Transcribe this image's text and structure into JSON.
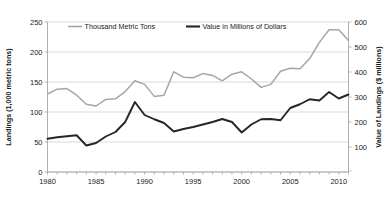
{
  "chart_data": {
    "type": "line",
    "title": "",
    "xlabel": "",
    "ylabel": "Landings (1,000 metric tons)",
    "y2label": "Value of Landings ($ millions)",
    "grid": true,
    "legend_position": "top-inside",
    "xlim": [
      1980,
      2011
    ],
    "ylim": [
      0,
      250
    ],
    "y2lim": [
      0,
      600
    ],
    "x_tick_labels": [
      "1980",
      "1985",
      "1990",
      "1995",
      "2000",
      "2005",
      "2010"
    ],
    "x_tick_values": [
      1980,
      1985,
      1990,
      1995,
      2000,
      2005,
      2010
    ],
    "x_minor_ticks_every": 1,
    "y_tick_labels": [
      "0",
      "50",
      "100",
      "150",
      "200",
      "250"
    ],
    "y_tick_values": [
      0,
      50,
      100,
      150,
      200,
      250
    ],
    "y2_tick_labels": [
      "100",
      "200",
      "300",
      "400",
      "500",
      "600"
    ],
    "y2_tick_values": [
      100,
      200,
      300,
      400,
      500,
      600
    ],
    "x": [
      1980,
      1981,
      1982,
      1983,
      1984,
      1985,
      1986,
      1987,
      1988,
      1989,
      1990,
      1991,
      1992,
      1993,
      1994,
      1995,
      1996,
      1997,
      1998,
      1999,
      2000,
      2001,
      2002,
      2003,
      2004,
      2005,
      2006,
      2007,
      2008,
      2009,
      2010,
      2011
    ],
    "series": [
      {
        "name": "Thousand Metric Tons",
        "color": "#a6a6a6",
        "axis": "left",
        "units": "1,000 metric tons",
        "values": [
          130,
          138,
          139,
          128,
          113,
          110,
          121,
          122,
          134,
          152,
          146,
          126,
          128,
          167,
          158,
          157,
          164,
          161,
          152,
          163,
          167,
          155,
          141,
          146,
          168,
          173,
          172,
          189,
          216,
          237,
          237,
          219
        ]
      },
      {
        "name": "Value in Millions of Dollars",
        "color": "#262626",
        "axis": "right",
        "units": "$ millions",
        "values": [
          133,
          139,
          143,
          147,
          106,
          116,
          142,
          160,
          200,
          280,
          228,
          211,
          196,
          162,
          172,
          180,
          190,
          200,
          212,
          200,
          158,
          190,
          211,
          212,
          207,
          256,
          271,
          291,
          286,
          320,
          294,
          310
        ]
      }
    ],
    "series_right_axis_plotted": [
      133,
      139,
      143,
      147,
      106,
      116,
      142,
      160,
      200,
      280,
      228,
      211,
      196,
      162,
      172,
      180,
      190,
      200,
      212,
      200,
      158,
      190,
      211,
      212,
      207,
      256,
      271,
      291,
      286,
      320,
      294,
      310
    ]
  },
  "legend": {
    "items": [
      {
        "label": "Thousand Metric Tons",
        "color": "#a6a6a6"
      },
      {
        "label": "Value in Millions of Dollars",
        "color": "#262626"
      }
    ]
  },
  "axes": {
    "left_title": "Landings (1,000 metric tons)",
    "right_title": "Value of Landings ($ millions)"
  }
}
